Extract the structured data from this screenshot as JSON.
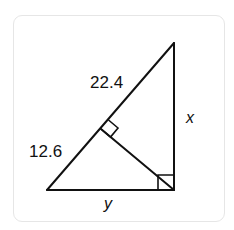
{
  "diagram": {
    "type": "right-triangle-with-altitude",
    "labels": {
      "upper_hypotenuse_segment": "22.4",
      "lower_hypotenuse_segment": "12.6",
      "vertical_leg": "x",
      "horizontal_leg": "y"
    },
    "right_angle_markers": [
      "altitude-foot",
      "bottom-right-vertex"
    ],
    "colors": {
      "stroke": "#111111",
      "background": "#ffffff",
      "card_border": "#e6e6e6"
    }
  }
}
